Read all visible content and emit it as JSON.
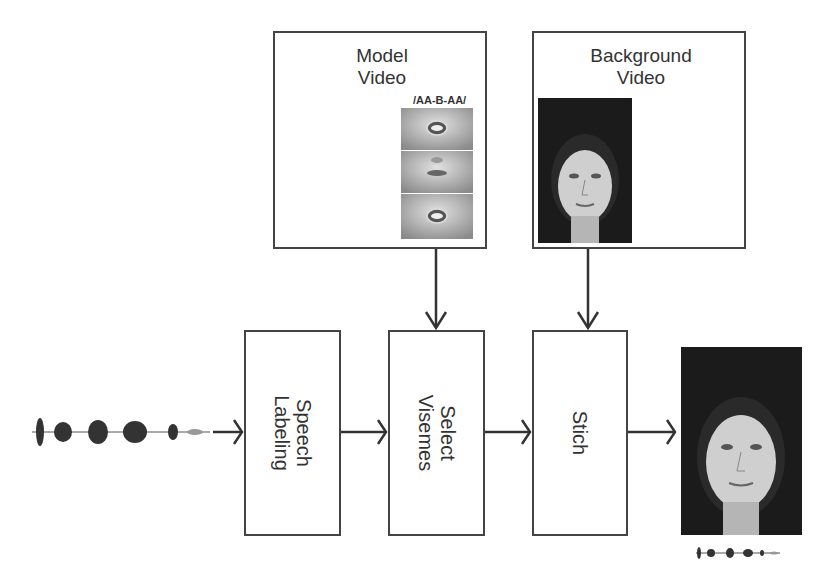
{
  "diagram": {
    "inputs": {
      "model_video": {
        "title_line1": "Model",
        "title_line2": "Video",
        "viseme_sequence": "/AA-B-AA/"
      },
      "background_video": {
        "title_line1": "Background",
        "title_line2": "Video"
      }
    },
    "pipeline": [
      {
        "id": "speech-labeling",
        "line1": "Speech",
        "line2": "Labeling"
      },
      {
        "id": "select-visemes",
        "line1": "Select",
        "line2": "Visemes"
      },
      {
        "id": "stitch",
        "line1": "Stich",
        "line2": ""
      }
    ],
    "input_signal": "speech-waveform",
    "output": {
      "image": "synthesized-face",
      "audio": "speech-waveform"
    },
    "colors": {
      "stroke": "#444444",
      "text": "#333333",
      "background": "#ffffff",
      "photo_bg": "#1b1b1b"
    }
  }
}
